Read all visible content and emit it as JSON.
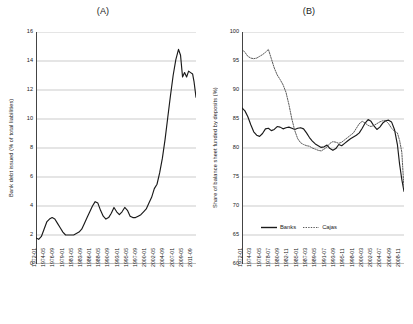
{
  "figure": {
    "background": "#ffffff",
    "line_color": "#1a1a1a"
  },
  "panel_a": {
    "title": "(A)",
    "ylabel": "Bank debt issued (% of total liabilities)",
    "chart_data": {
      "type": "line",
      "title": "(A)",
      "xlabel": "",
      "ylabel": "Bank debt issued (% of total liabilities)",
      "ylim": [
        0,
        16
      ],
      "yticks": [
        0,
        2,
        4,
        6,
        8,
        10,
        12,
        14,
        16
      ],
      "grid": true,
      "legend": null,
      "tick_labels": [
        "1972-01",
        "1974-05",
        "1976-09",
        "1979-01",
        "1981-05",
        "1983-09",
        "1986-01",
        "1988-05",
        "1990-09",
        "1993-01",
        "1995-05",
        "1997-09",
        "2000-01",
        "2002-05",
        "2004-09",
        "2007-01",
        "2009-05",
        "2011-09"
      ],
      "x_start": "1972-01",
      "x_end": "2011-09",
      "x_tick_interval_months": 28,
      "series": [
        {
          "name": "Bank debt issued",
          "style": "solid",
          "color": "#1a1a1a",
          "x": [
            "1972-01",
            "1972-09",
            "1973-05",
            "1974-01",
            "1974-09",
            "1975-05",
            "1976-01",
            "1976-09",
            "1977-05",
            "1978-01",
            "1978-09",
            "1979-05",
            "1980-01",
            "1980-09",
            "1981-05",
            "1982-01",
            "1982-09",
            "1983-05",
            "1984-01",
            "1984-09",
            "1985-05",
            "1986-01",
            "1986-09",
            "1987-05",
            "1988-01",
            "1988-09",
            "1989-05",
            "1990-01",
            "1990-09",
            "1991-05",
            "1992-01",
            "1992-09",
            "1993-05",
            "1994-01",
            "1994-09",
            "1995-05",
            "1996-01",
            "1996-09",
            "1997-05",
            "1998-01",
            "1998-09",
            "1999-05",
            "2000-01",
            "2000-09",
            "2001-05",
            "2002-01",
            "2002-09",
            "2003-05",
            "2004-01",
            "2004-09",
            "2005-05",
            "2006-01",
            "2006-09",
            "2007-05",
            "2007-11",
            "2008-05",
            "2008-11",
            "2009-05",
            "2009-11",
            "2010-05",
            "2010-11",
            "2011-03",
            "2011-09"
          ],
          "values": [
            1.8,
            1.7,
            1.9,
            2.4,
            2.9,
            3.1,
            3.2,
            3.1,
            2.8,
            2.5,
            2.2,
            2.0,
            2.0,
            2.0,
            2.0,
            2.1,
            2.2,
            2.4,
            2.8,
            3.2,
            3.6,
            4.0,
            4.3,
            4.2,
            3.7,
            3.3,
            3.1,
            3.2,
            3.5,
            3.9,
            3.6,
            3.4,
            3.6,
            3.9,
            3.7,
            3.3,
            3.2,
            3.2,
            3.3,
            3.4,
            3.6,
            3.8,
            4.2,
            4.6,
            5.2,
            5.5,
            6.3,
            7.3,
            8.6,
            10.1,
            11.6,
            13.0,
            14.1,
            14.8,
            14.4,
            12.9,
            13.2,
            12.9,
            13.3,
            13.2,
            13.1,
            12.6,
            11.5
          ]
        }
      ]
    }
  },
  "panel_b": {
    "title": "(B)",
    "ylabel": "Share of balance sheet funded by deposits (%)",
    "chart_data": {
      "type": "line",
      "title": "(B)",
      "xlabel": "",
      "ylabel": "Share of balance sheet funded by deposits (%)",
      "ylim": [
        60,
        100
      ],
      "yticks": [
        60,
        65,
        70,
        75,
        80,
        85,
        90,
        95,
        100
      ],
      "grid": true,
      "legend_position": "bottom-center",
      "tick_labels": [
        "1972-01",
        "1974-03",
        "1976-05",
        "1978-07",
        "1980-09",
        "1982-11",
        "1985-01",
        "1987-03",
        "1989-05",
        "1991-07",
        "1993-09",
        "1995-11",
        "1998-01",
        "2000-03",
        "2002-05",
        "2004-07",
        "2006-09",
        "2008-11"
      ],
      "x_start": "1972-01",
      "x_end": "2008-11",
      "x_tick_interval_months": 26,
      "series": [
        {
          "name": "Banks",
          "style": "solid",
          "color": "#1a1a1a",
          "x": [
            "1972-01",
            "1972-09",
            "1973-05",
            "1974-01",
            "1974-09",
            "1975-05",
            "1976-01",
            "1976-09",
            "1977-05",
            "1978-01",
            "1978-09",
            "1979-05",
            "1980-01",
            "1980-09",
            "1981-05",
            "1982-01",
            "1982-09",
            "1983-05",
            "1984-01",
            "1984-09",
            "1985-05",
            "1986-01",
            "1986-09",
            "1987-05",
            "1988-01",
            "1988-09",
            "1989-05",
            "1990-01",
            "1990-09",
            "1991-05",
            "1992-01",
            "1992-09",
            "1993-05",
            "1994-01",
            "1994-09",
            "1995-05",
            "1996-01",
            "1996-09",
            "1997-05",
            "1998-01",
            "1998-09",
            "1999-05",
            "2000-01",
            "2000-09",
            "2001-05",
            "2002-01",
            "2002-09",
            "2003-05",
            "2004-01",
            "2004-09",
            "2005-05",
            "2006-01",
            "2006-09",
            "2007-05",
            "2007-11",
            "2008-05",
            "2008-11"
          ],
          "values": [
            86.9,
            86.4,
            85.4,
            84.0,
            82.8,
            82.2,
            82.0,
            82.5,
            83.3,
            83.4,
            83.0,
            83.2,
            83.7,
            83.6,
            83.3,
            83.5,
            83.6,
            83.4,
            83.2,
            83.4,
            83.5,
            83.3,
            82.6,
            81.8,
            81.2,
            80.7,
            80.4,
            80.1,
            80.2,
            80.5,
            79.9,
            79.6,
            79.9,
            80.6,
            80.4,
            80.8,
            81.2,
            81.6,
            81.9,
            82.2,
            82.6,
            83.4,
            84.3,
            84.9,
            84.6,
            83.8,
            83.2,
            83.6,
            84.3,
            84.7,
            84.8,
            84.5,
            83.2,
            80.6,
            77.2,
            74.6,
            72.5
          ]
        },
        {
          "name": "Cajas",
          "style": "dotted",
          "color": "#4a4a4a",
          "x": [
            "1972-01",
            "1972-09",
            "1973-05",
            "1974-01",
            "1974-09",
            "1975-05",
            "1976-01",
            "1976-09",
            "1977-05",
            "1978-01",
            "1978-09",
            "1979-05",
            "1980-01",
            "1980-09",
            "1981-05",
            "1982-01",
            "1982-09",
            "1983-05",
            "1984-01",
            "1984-09",
            "1985-05",
            "1986-01",
            "1986-09",
            "1987-05",
            "1988-01",
            "1988-09",
            "1989-05",
            "1990-01",
            "1990-09",
            "1991-05",
            "1992-01",
            "1992-09",
            "1993-05",
            "1994-01",
            "1994-09",
            "1995-05",
            "1996-01",
            "1996-09",
            "1997-05",
            "1998-01",
            "1998-09",
            "1999-05",
            "2000-01",
            "2000-09",
            "2001-05",
            "2002-01",
            "2002-09",
            "2003-05",
            "2004-01",
            "2004-09",
            "2005-05",
            "2006-01",
            "2006-09",
            "2007-05",
            "2007-11",
            "2008-05",
            "2008-11"
          ],
          "values": [
            97.0,
            96.5,
            95.8,
            95.5,
            95.4,
            95.5,
            95.8,
            96.1,
            96.5,
            97.0,
            95.4,
            93.8,
            92.6,
            91.8,
            90.9,
            89.6,
            87.5,
            85.0,
            83.0,
            81.6,
            80.9,
            80.6,
            80.4,
            80.3,
            80.0,
            79.8,
            79.6,
            79.5,
            79.8,
            80.2,
            80.8,
            81.1,
            81.0,
            80.8,
            81.0,
            81.4,
            81.8,
            82.2,
            82.6,
            83.4,
            84.2,
            84.6,
            84.3,
            83.9,
            83.7,
            83.9,
            84.2,
            84.5,
            84.7,
            84.7,
            84.2,
            83.4,
            82.9,
            82.6,
            81.3,
            79.3,
            73.0
          ]
        }
      ]
    },
    "legend": {
      "items": [
        {
          "label": "Banks",
          "style": "solid"
        },
        {
          "label": "Cajas",
          "style": "dotted"
        }
      ]
    }
  }
}
